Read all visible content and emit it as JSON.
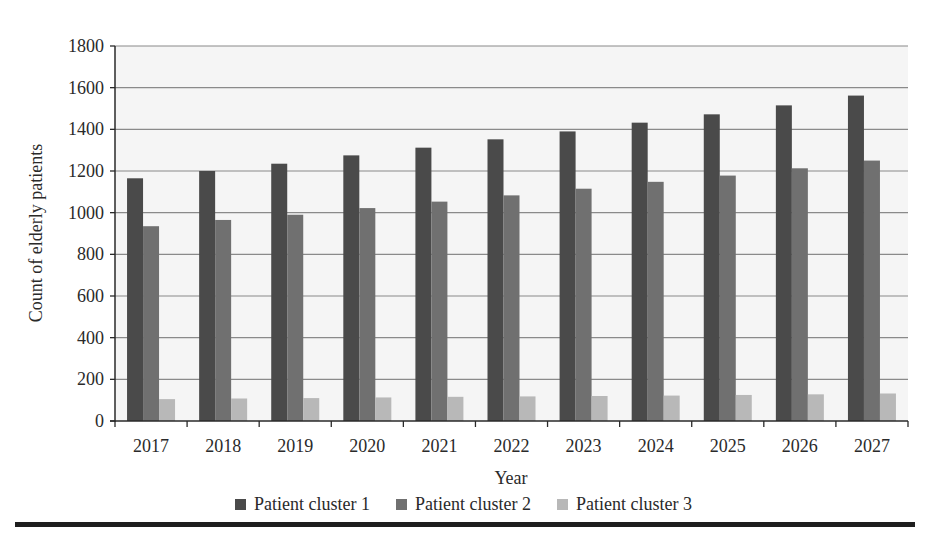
{
  "chart_data": {
    "type": "bar",
    "title": "",
    "xlabel": "Year",
    "ylabel": "Count of elderly patients",
    "ylim": [
      0,
      1800
    ],
    "yticks": [
      0,
      200,
      400,
      600,
      800,
      1000,
      1200,
      1400,
      1600,
      1800
    ],
    "grid": true,
    "legend_position": "bottom",
    "categories": [
      "2017",
      "2018",
      "2019",
      "2020",
      "2021",
      "2022",
      "2023",
      "2024",
      "2025",
      "2026",
      "2027"
    ],
    "series": [
      {
        "name": "Patient cluster 1",
        "color": "#4a4a4a",
        "values": [
          1165,
          1200,
          1235,
          1275,
          1312,
          1352,
          1390,
          1432,
          1472,
          1515,
          1562
        ]
      },
      {
        "name": "Patient cluster 2",
        "color": "#707070",
        "values": [
          935,
          965,
          990,
          1022,
          1053,
          1083,
          1115,
          1148,
          1178,
          1213,
          1250
        ]
      },
      {
        "name": "Patient cluster 3",
        "color": "#b8b8b8",
        "values": [
          105,
          108,
          110,
          113,
          116,
          118,
          120,
          122,
          125,
          128,
          132
        ]
      }
    ]
  },
  "colors": {
    "plot_background": "#f5f5f5",
    "gridline": "#8a8a8a",
    "axis": "#2a2a2a",
    "rule": "#1e1e1e"
  }
}
